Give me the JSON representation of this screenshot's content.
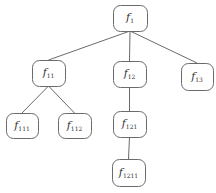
{
  "diagram": {
    "type": "tree",
    "colors": {
      "stroke": "#6a6a6a",
      "text": "#333333",
      "background": "#ffffff"
    },
    "nodes": [
      {
        "id": "f1",
        "base": "f",
        "sub": "1"
      },
      {
        "id": "f11",
        "base": "f",
        "sub": "11"
      },
      {
        "id": "f12",
        "base": "f",
        "sub": "12"
      },
      {
        "id": "f13",
        "base": "f",
        "sub": "13"
      },
      {
        "id": "f111",
        "base": "f",
        "sub": "111"
      },
      {
        "id": "f112",
        "base": "f",
        "sub": "112"
      },
      {
        "id": "f121",
        "base": "f",
        "sub": "121"
      },
      {
        "id": "f1211",
        "base": "f",
        "sub": "1211"
      }
    ],
    "edges": [
      {
        "from": "f1",
        "to": "f11"
      },
      {
        "from": "f1",
        "to": "f12"
      },
      {
        "from": "f1",
        "to": "f13"
      },
      {
        "from": "f11",
        "to": "f111"
      },
      {
        "from": "f11",
        "to": "f112"
      },
      {
        "from": "f12",
        "to": "f121"
      },
      {
        "from": "f121",
        "to": "f1211"
      }
    ]
  }
}
